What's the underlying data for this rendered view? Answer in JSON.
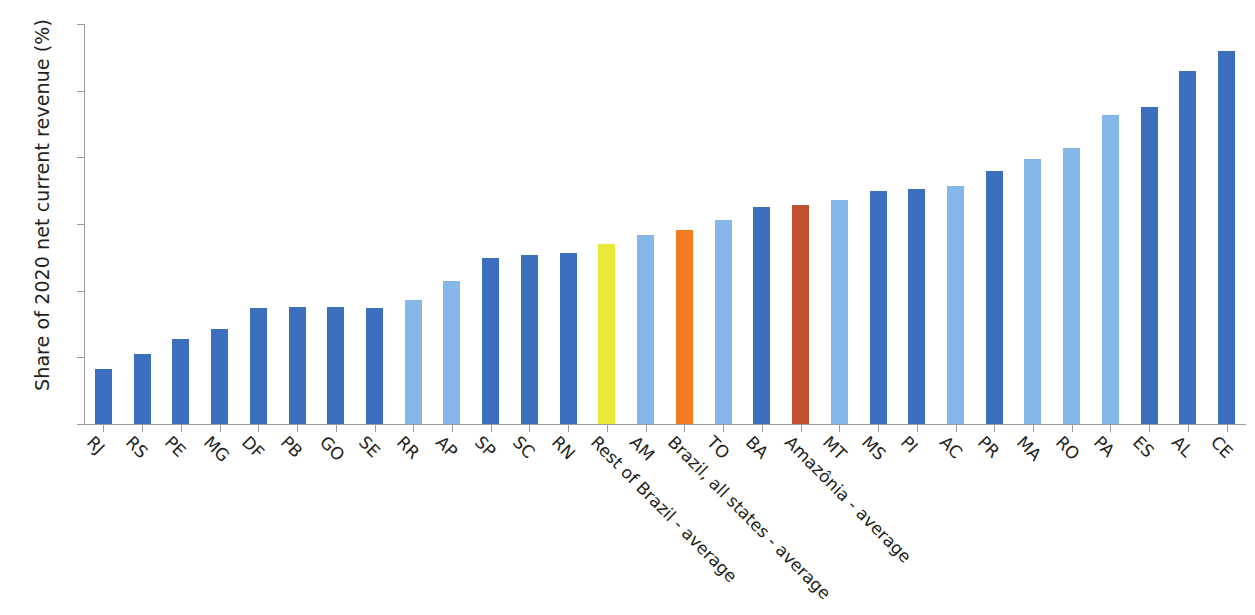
{
  "chart_data": {
    "type": "bar",
    "title": "",
    "subtitle": "",
    "xlabel": "",
    "ylabel": "Share of 2020 net current revenue (%)",
    "ylim": [
      0,
      12
    ],
    "yticks": [
      0,
      2,
      4,
      6,
      8,
      10,
      12
    ],
    "ytick_labels": [
      "0",
      "2",
      "4",
      "6",
      "8",
      "10",
      "12"
    ],
    "grid": false,
    "legend": "none",
    "categories": [
      "RJ",
      "RS",
      "PE",
      "MG",
      "DF",
      "PB",
      "GO",
      "SE",
      "RR",
      "AP",
      "SP",
      "SC",
      "RN",
      "Rest of Brazil - average",
      "AM",
      "Brazil, all states - average",
      "TO",
      "BA",
      "Amazônia - average",
      "MT",
      "MS",
      "PI",
      "AC",
      "PR",
      "MA",
      "RO",
      "PA",
      "ES",
      "AL",
      "CE"
    ],
    "values": [
      1.65,
      2.1,
      2.55,
      2.85,
      3.47,
      3.5,
      3.5,
      3.48,
      3.72,
      4.28,
      4.97,
      5.06,
      5.12,
      5.4,
      5.66,
      5.82,
      6.12,
      6.5,
      6.57,
      6.73,
      7.0,
      7.05,
      7.13,
      7.58,
      7.95,
      8.28,
      9.27,
      9.5,
      10.58,
      11.18
    ],
    "bar_colors": [
      "#3c6fbe",
      "#3c6fbe",
      "#3c6fbe",
      "#3c6fbe",
      "#3c6fbe",
      "#3c6fbe",
      "#3c6fbe",
      "#3c6fbe",
      "#85b7e8",
      "#85b7e8",
      "#3c6fbe",
      "#3c6fbe",
      "#3c6fbe",
      "#e9e93a",
      "#85b7e8",
      "#f57c20",
      "#85b7e8",
      "#3c6fbe",
      "#c0512e",
      "#85b7e8",
      "#3c6fbe",
      "#3c6fbe",
      "#85b7e8",
      "#3c6fbe",
      "#85b7e8",
      "#85b7e8",
      "#85b7e8",
      "#3c6fbe",
      "#3c6fbe",
      "#3c6fbe"
    ],
    "color_key": {
      "state_dark_blue": "#3c6fbe",
      "state_light_blue": "#85b7e8",
      "rest_of_brazil_yellow": "#e9e93a",
      "brazil_all_states_orange": "#f57c20",
      "amazonia_red": "#c0512e",
      "axis_gray": "#9a9a9a",
      "text": "#231f20",
      "background": "#ffffff"
    }
  }
}
